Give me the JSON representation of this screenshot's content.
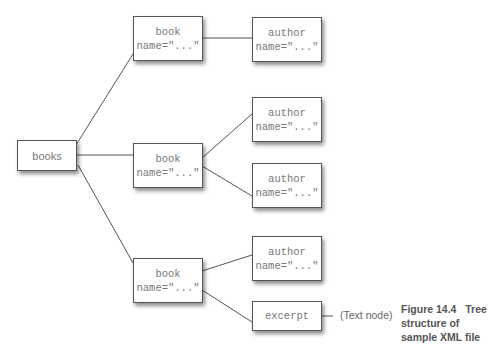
{
  "diagram": {
    "nodes": {
      "books": {
        "label": "books"
      },
      "book1": {
        "line1": "book",
        "line2": "name=\"...\""
      },
      "book2": {
        "line1": "book",
        "line2": "name=\"...\""
      },
      "book3": {
        "line1": "book",
        "line2": "name=\"...\""
      },
      "author1": {
        "line1": "author",
        "line2": "name=\"...\""
      },
      "author2": {
        "line1": "author",
        "line2": "name=\"...\""
      },
      "author3": {
        "line1": "author",
        "line2": "name=\"...\""
      },
      "author4": {
        "line1": "author",
        "line2": "name=\"...\""
      },
      "excerpt": {
        "label": "excerpt"
      }
    },
    "edges": [
      [
        "books",
        "book1"
      ],
      [
        "books",
        "book2"
      ],
      [
        "books",
        "book3"
      ],
      [
        "book1",
        "author1"
      ],
      [
        "book2",
        "author2"
      ],
      [
        "book2",
        "author3"
      ],
      [
        "book3",
        "author4"
      ],
      [
        "book3",
        "excerpt"
      ],
      [
        "excerpt",
        "text-node"
      ]
    ],
    "text_node_label": "(Text node)"
  },
  "caption": {
    "figure": "Figure 14.4",
    "text": "Tree structure of sample XML file"
  },
  "colors": {
    "border": "#555555",
    "text": "#777777",
    "line": "#555555"
  }
}
